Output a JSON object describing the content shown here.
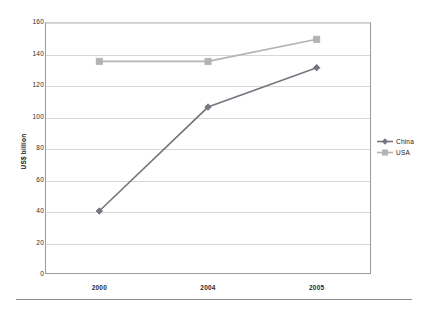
{
  "chart_data": {
    "type": "line",
    "title": "",
    "subtitle": "",
    "xlabel": "",
    "ylabel": "US$ billion",
    "categories": [
      "2000",
      "2004",
      "2005"
    ],
    "series": [
      {
        "name": "China",
        "values": [
          40,
          106,
          131
        ],
        "color": "#767680",
        "marker": "diamond"
      },
      {
        "name": "USA",
        "values": [
          135,
          135,
          149
        ],
        "color": "#b3b3b3",
        "marker": "square"
      }
    ],
    "ylim": [
      0,
      160
    ],
    "yticks": [
      0,
      20,
      40,
      60,
      80,
      100,
      120,
      140,
      160
    ],
    "ytick_labels": [
      "0",
      "20",
      "40",
      "60",
      "80",
      "100",
      "120",
      "140",
      "160"
    ],
    "grid": "horizontal",
    "legend_position": "right",
    "annotations": []
  },
  "legend": {
    "items": [
      {
        "label": "China"
      },
      {
        "label": "USA"
      }
    ]
  },
  "colors": {
    "china": "#767680",
    "usa": "#b3b3b3",
    "gridline": "#d7d7d7",
    "axis": "#9a9a9a",
    "text": "#1a1a1a"
  }
}
